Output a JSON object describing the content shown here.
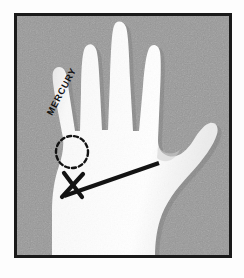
{
  "figure": {
    "caption_text": "MERCURY",
    "frame": {
      "border_color": "#1a1a1a",
      "border_width_px": 3,
      "x": 14,
      "y": 13,
      "width": 218,
      "height": 245
    },
    "background": {
      "plate_color": "#9b9b9b",
      "page_color": "#fdfdfd",
      "texture": "halftone-grain"
    },
    "hand": {
      "fill_color": "#fbfbfb",
      "shadow_color": "#d9d9d9",
      "orientation": "palm-facing-viewer",
      "digits": [
        {
          "name": "little-finger",
          "label": "MERCURY",
          "tip_x": 57,
          "tip_y": 68
        },
        {
          "name": "ring-finger",
          "label": "",
          "tip_x": 89,
          "tip_y": 41
        },
        {
          "name": "middle-finger",
          "label": "",
          "tip_x": 117,
          "tip_y": 23
        },
        {
          "name": "index-finger",
          "label": "",
          "tip_x": 149,
          "tip_y": 43
        },
        {
          "name": "thumb",
          "label": "",
          "tip_x": 208,
          "tip_y": 126
        }
      ]
    },
    "annotations": {
      "mercury_text": "MERCURY",
      "mercury_text_rotation_deg": -62,
      "mercury_text_x": 52,
      "mercury_text_y": 116,
      "dashed_circle": {
        "name": "mercury-mount",
        "center_x": 72,
        "center_y": 152,
        "radius": 16,
        "stroke_color": "#131313",
        "dash_pattern": "4 3"
      },
      "cross_mark": {
        "name": "cross-mark",
        "center_x": 73,
        "center_y": 185,
        "size": 24,
        "stroke_color": "#131313"
      },
      "measure_line": {
        "name": "heart-line",
        "x1": 64,
        "y1": 196,
        "x2": 159,
        "y2": 163,
        "stroke_color": "#131313",
        "stroke_width": 4
      }
    }
  }
}
